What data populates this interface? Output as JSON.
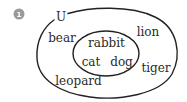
{
  "question": {
    "number": "1",
    "badge_color": "#9a9a9a"
  },
  "venn": {
    "universal_label": "U",
    "stroke_color": "#222222",
    "outer_set": {
      "elements_outside_inner": [
        "bear",
        "lion",
        "tiger",
        "leopard"
      ]
    },
    "inner_set": {
      "elements": [
        "rabbit",
        "cat",
        "dog"
      ]
    },
    "labels": {
      "u": "U",
      "bear": "bear",
      "lion": "lion",
      "rabbit": "rabbit",
      "cat": "cat",
      "dog": "dog",
      "tiger": "tiger",
      "leopard": "leopard"
    }
  }
}
